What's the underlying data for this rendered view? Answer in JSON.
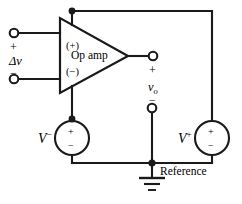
{
  "figure": {
    "kind": "circuit-schematic",
    "stroke_color": "#1a1a1a",
    "background_color": "#ffffff",
    "text_color": "#000000"
  },
  "opamp": {
    "body_label": "Op amp",
    "noninverting_pin_label": "(+)",
    "inverting_pin_label": "(−)"
  },
  "input": {
    "plus_sign": "+",
    "minus_sign": "−",
    "signal_label": "Δv"
  },
  "output": {
    "plus_sign": "+",
    "minus_sign": "−",
    "voltage_symbol": "v",
    "voltage_subscript": "o"
  },
  "sources": {
    "negative_supply": {
      "name": "V",
      "superscript": "−",
      "terminal_top": "+",
      "terminal_bottom": "−"
    },
    "positive_supply": {
      "name": "V",
      "superscript": "+",
      "terminal_top": "+",
      "terminal_bottom": "−"
    }
  },
  "ground": {
    "label": "Reference"
  }
}
